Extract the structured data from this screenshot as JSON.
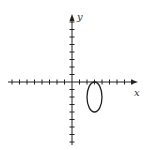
{
  "diagram": {
    "type": "coordinate-plane-with-ellipse",
    "axes": {
      "x_label": "x",
      "y_label": "y",
      "x_ticks_negative": 8,
      "x_ticks_positive": 8,
      "y_ticks_positive": 8,
      "y_ticks_negative": 8
    },
    "ellipse": {
      "center_units": [
        3,
        -2
      ],
      "semi_axis_x_units": 1,
      "semi_axis_y_units": 2,
      "description": "Vertical ellipse in quadrant IV tangent to the x-axis"
    },
    "colors": {
      "stroke": "#222222",
      "background": "#ffffff"
    }
  }
}
